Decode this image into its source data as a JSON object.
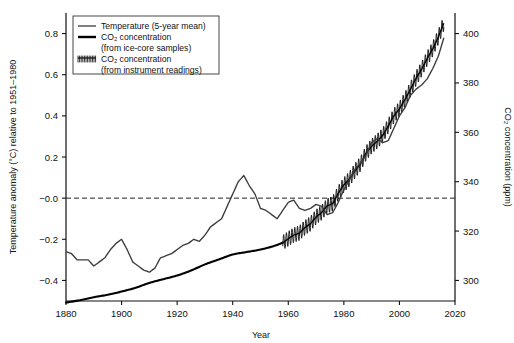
{
  "chart_data": {
    "type": "line",
    "title": "",
    "xlabel": "Year",
    "ylabel": "Temperature anomaly (°C) relative to 1951–1980",
    "ylabel_right": "CO₂ concentration (ppm)",
    "xlim": [
      1880,
      2020
    ],
    "ylim": [
      -0.5,
      0.9
    ],
    "ylim_right": [
      291.67,
      408.33
    ],
    "xticks": [
      1880,
      1900,
      1920,
      1940,
      1960,
      1980,
      2000,
      2020
    ],
    "xticklabels": [
      "1880",
      "1900",
      "1920",
      "1940",
      "1960",
      "1980",
      "2000",
      "2020"
    ],
    "yticks": [
      -0.4,
      -0.2,
      0.0,
      0.2,
      0.4,
      0.6,
      0.8
    ],
    "yticklabels": [
      "−0.4",
      "−0.2",
      "−0.0",
      "0.2",
      "0.4",
      "0.6",
      "0.8"
    ],
    "yticks_right": [
      300,
      320,
      340,
      360,
      380,
      400
    ],
    "yticklabels_right": [
      "300",
      "320",
      "340",
      "360",
      "380",
      "400"
    ],
    "grid": false,
    "zero_reference_line": 0.0,
    "legend_position": "top-left",
    "legend": [
      {
        "label": "Temperature (5-year mean)",
        "swatch": "thin-line",
        "color": "#555555"
      },
      {
        "label": "CO₂ concentration",
        "sublabel": "(from ice-core samples)",
        "swatch": "thick-line",
        "color": "#000000"
      },
      {
        "label": "CO₂ concentration",
        "sublabel": "(from instrument readings)",
        "swatch": "hatched",
        "color": "#000000"
      }
    ],
    "series": [
      {
        "name": "Temperature (5-year mean)",
        "axis": "left",
        "units": "°C",
        "x": [
          1880,
          1882,
          1884,
          1886,
          1888,
          1890,
          1892,
          1894,
          1896,
          1898,
          1900,
          1902,
          1904,
          1906,
          1908,
          1910,
          1912,
          1914,
          1916,
          1918,
          1920,
          1922,
          1924,
          1926,
          1928,
          1930,
          1932,
          1934,
          1936,
          1938,
          1940,
          1942,
          1944,
          1946,
          1948,
          1950,
          1952,
          1954,
          1956,
          1958,
          1960,
          1962,
          1964,
          1966,
          1968,
          1970,
          1972,
          1974,
          1976,
          1978,
          1980,
          1982,
          1984,
          1986,
          1988,
          1990,
          1992,
          1994,
          1996,
          1998,
          2000,
          2002,
          2004,
          2006,
          2008,
          2010,
          2012,
          2014,
          2016
        ],
        "values": [
          -0.26,
          -0.27,
          -0.3,
          -0.3,
          -0.3,
          -0.33,
          -0.31,
          -0.29,
          -0.25,
          -0.22,
          -0.2,
          -0.25,
          -0.31,
          -0.33,
          -0.35,
          -0.36,
          -0.34,
          -0.29,
          -0.28,
          -0.27,
          -0.25,
          -0.23,
          -0.22,
          -0.2,
          -0.21,
          -0.18,
          -0.14,
          -0.12,
          -0.1,
          -0.04,
          0.02,
          0.08,
          0.11,
          0.06,
          0.02,
          -0.05,
          -0.06,
          -0.08,
          -0.1,
          -0.06,
          -0.02,
          -0.01,
          -0.05,
          -0.06,
          -0.05,
          -0.03,
          -0.04,
          -0.08,
          -0.07,
          -0.02,
          0.04,
          0.09,
          0.14,
          0.17,
          0.21,
          0.27,
          0.29,
          0.27,
          0.28,
          0.34,
          0.4,
          0.44,
          0.5,
          0.53,
          0.55,
          0.58,
          0.63,
          0.69,
          0.78
        ]
      },
      {
        "name": "CO2 concentration (from ice-core samples)",
        "axis": "right",
        "units": "ppm",
        "x": [
          1880,
          1885,
          1890,
          1895,
          1900,
          1905,
          1910,
          1915,
          1920,
          1925,
          1930,
          1935,
          1940,
          1945,
          1950,
          1955,
          1958
        ],
        "values": [
          291.0,
          292.0,
          293.2,
          294.2,
          295.5,
          297.0,
          299.0,
          300.5,
          302.0,
          304.0,
          306.5,
          308.5,
          310.5,
          311.5,
          312.5,
          314.0,
          315.3
        ]
      },
      {
        "name": "CO2 concentration (from instrument readings)",
        "axis": "right",
        "units": "ppm",
        "note": "annual mean with seasonal sawtooth oscillation of about ±3 ppm",
        "seasonal_amplitude": 3.0,
        "x": [
          1958,
          1960,
          1962,
          1964,
          1966,
          1968,
          1970,
          1972,
          1974,
          1976,
          1978,
          1980,
          1982,
          1984,
          1986,
          1988,
          1990,
          1992,
          1994,
          1996,
          1998,
          2000,
          2002,
          2004,
          2006,
          2008,
          2010,
          2012,
          2014,
          2016
        ],
        "values": [
          315.3,
          316.9,
          318.4,
          319.2,
          321.4,
          323.0,
          325.7,
          327.5,
          330.2,
          331.1,
          335.4,
          338.7,
          341.1,
          344.4,
          347.2,
          351.6,
          354.4,
          356.4,
          358.8,
          362.6,
          366.7,
          369.5,
          373.3,
          377.5,
          381.9,
          385.6,
          389.9,
          393.8,
          398.6,
          404.2
        ]
      }
    ]
  }
}
